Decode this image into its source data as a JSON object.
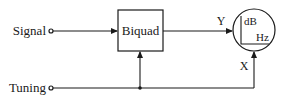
{
  "diagram": {
    "inputs": {
      "signal": {
        "label": "Signal"
      },
      "tuning": {
        "label": "Tuning"
      }
    },
    "block": {
      "label": "Biquad"
    },
    "display": {
      "y_port": "Y",
      "x_port": "X",
      "axis_y": "dB",
      "axis_x": "Hz"
    },
    "colors": {
      "stroke": "#1a1a1a",
      "background": "#ffffff"
    }
  }
}
